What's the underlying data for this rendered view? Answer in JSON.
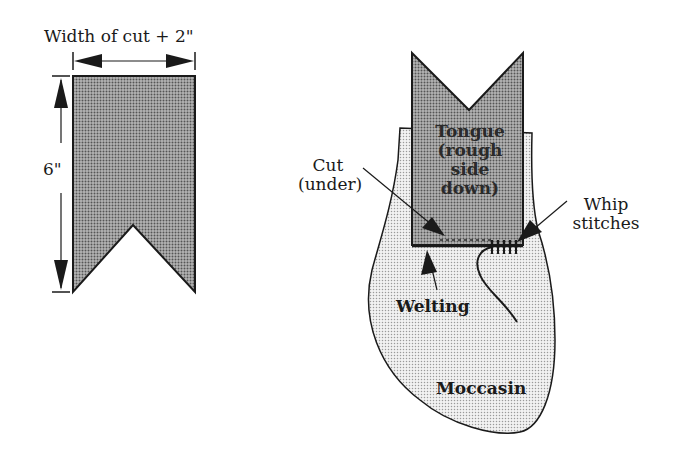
{
  "left_figure": {
    "width_label": "Width of cut + 2\"",
    "height_label": "6\""
  },
  "right_figure": {
    "tongue_label_lines": [
      "Tongue",
      "(rough",
      "side",
      "down)"
    ],
    "cut_label_lines": [
      "Cut",
      "(under)"
    ],
    "whip_label_lines": [
      "Whip",
      "stitches"
    ],
    "welting_label": "Welting",
    "moccasin_label": "Moccasin"
  },
  "colors": {
    "tongue_fill": "#8f8f8f",
    "moccasin_fill": "#d6d6d6",
    "outline": "#1a1a1a"
  }
}
